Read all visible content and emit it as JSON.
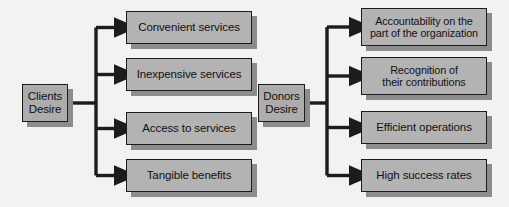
{
  "diagram": {
    "type": "tree-bracket",
    "background_color": "#f3f2f0",
    "node_fill_color": "#b3b3b3",
    "node_border_color": "#1c1c1c",
    "node_shadow_color": "#8c8c8c",
    "connector_color": "#1c1c1c",
    "groups": [
      {
        "id": "clients",
        "root": {
          "id": "clients-desire",
          "label": "Clients\nDesire",
          "line1": "Clients",
          "line2": "Desire",
          "x": 22,
          "y": 84,
          "width": 46,
          "height": 38
        },
        "trunk_x": 96,
        "leaves": [
          {
            "id": "convenient-services",
            "label": "Convenient services",
            "x": 126,
            "y": 11,
            "width": 126,
            "height": 33
          },
          {
            "id": "inexpensive-services",
            "label": "Inexpensive services",
            "x": 126,
            "y": 58,
            "width": 126,
            "height": 33
          },
          {
            "id": "access-to-services",
            "label": "Access to services",
            "x": 126,
            "y": 112,
            "width": 126,
            "height": 33
          },
          {
            "id": "tangible-benefits",
            "label": "Tangible benefits",
            "x": 126,
            "y": 159,
            "width": 126,
            "height": 33
          }
        ]
      },
      {
        "id": "donors",
        "root": {
          "id": "donors-desire",
          "label": "Donors\nDesire",
          "line1": "Donors",
          "line2": "Desire",
          "x": 258,
          "y": 84,
          "width": 47,
          "height": 38
        },
        "trunk_x": 327,
        "leaves": [
          {
            "id": "accountability",
            "label": "Accountability on the\npart of the organization",
            "line1": "Accountability on the",
            "line2": "part of the organization",
            "x": 361,
            "y": 8,
            "width": 126,
            "height": 38
          },
          {
            "id": "recognition",
            "label": "Recognition of\ntheir contributions",
            "line1": "Recognition of",
            "line2": "their contributions",
            "x": 361,
            "y": 57,
            "width": 126,
            "height": 38
          },
          {
            "id": "efficient-operations",
            "label": "Efficient operations",
            "x": 361,
            "y": 111,
            "width": 126,
            "height": 33
          },
          {
            "id": "high-success-rates",
            "label": "High success rates",
            "x": 361,
            "y": 159,
            "width": 126,
            "height": 33
          }
        ]
      }
    ]
  }
}
